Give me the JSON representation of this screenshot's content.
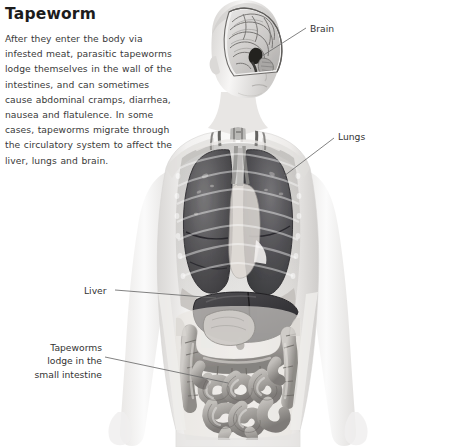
{
  "article": {
    "title": "Tapeworm",
    "body": "After they enter the body via infested meat, parasitic tapeworms lodge themselves in the wall of the intestines, and can sometimes cause abdominal cramps, diarrhea, nausea and flatulence. In some cases, tapeworms migrate through the circulatory system to affect the liver, lungs and brain."
  },
  "illustration": {
    "subject": "human-anatomy-torso-cutaway",
    "view": "anterior",
    "palette": {
      "background": "#ffffff",
      "skin_light": "#f3f2f1",
      "skin_mid": "#e2e0df",
      "skin_shadow": "#c9c6c4",
      "organ_dark": "#4a4a4c",
      "organ_mid": "#8e8d8c",
      "organ_light": "#c3c1bf",
      "outline": "#6a6a6a",
      "leader_line": "#6b6b6b",
      "label_text": "#333333",
      "title_text": "#1c1c1c",
      "body_text": "#3a3a3a"
    }
  },
  "callouts": [
    {
      "id": "brain",
      "label": "Brain",
      "organ": "brain"
    },
    {
      "id": "lungs",
      "label": "Lungs",
      "organ": "lungs"
    },
    {
      "id": "liver",
      "label": "Liver",
      "organ": "liver"
    },
    {
      "id": "tapeworms",
      "label": "Tapeworms\nlodge in the\nsmall intestine",
      "organ": "small-intestine"
    }
  ]
}
